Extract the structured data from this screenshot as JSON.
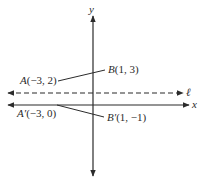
{
  "diagram": {
    "type": "coordinate-plane-reflection",
    "axes": {
      "x_label": "x",
      "y_label": "y"
    },
    "line": {
      "name": "ℓ",
      "style": "dashed",
      "description": "horizontal line of reflection y = 1"
    },
    "points": [
      {
        "name": "A",
        "coords": "(−3, 2)",
        "label": "A(−3, 2)"
      },
      {
        "name": "B",
        "coords": "(1, 3)",
        "label": "B(1, 3)"
      },
      {
        "name": "A′",
        "coords": "(−3, 0)",
        "label": "A′(−3, 0)"
      },
      {
        "name": "B′",
        "coords": "(1, −1)",
        "label": "B′(1, −1)"
      }
    ],
    "segments": [
      {
        "from": "A",
        "to": "B"
      },
      {
        "from": "A′",
        "to": "B′"
      }
    ],
    "colors": {
      "stroke": "#2b2b2b",
      "background": "#ffffff"
    }
  },
  "labels": {
    "y_axis": "y",
    "x_axis": "x",
    "line_l": "ℓ",
    "A_name": "A",
    "A_coords": "(−3, 2)",
    "B_name": "B",
    "B_coords": "(1, 3)",
    "A_prime_name": "A′",
    "A_prime_coords": "(−3, 0)",
    "B_prime_name": "B′",
    "B_prime_coords": "(1, −1)"
  }
}
